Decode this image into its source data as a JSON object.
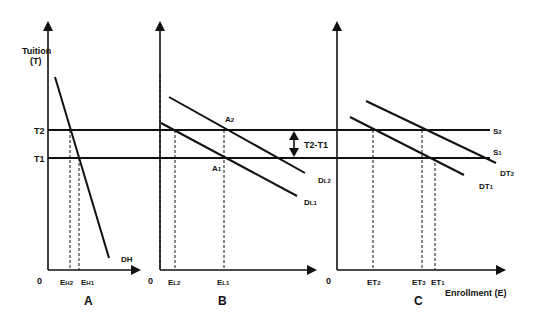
{
  "diagram": {
    "y_axis_label_line1": "Tuition",
    "y_axis_label_line2": "(T)",
    "x_axis_label": "Enrollment (E)",
    "tuition_levels": {
      "high": "T2",
      "low": "T1"
    },
    "difference_label": "T2-T1",
    "panels": [
      {
        "id": "A",
        "title": "A",
        "origin": "0",
        "curves": [
          {
            "label": "DH"
          }
        ],
        "x_ticks": [
          {
            "sub_main": "E",
            "sub": "H2"
          },
          {
            "sub_main": "E",
            "sub": "H1"
          }
        ]
      },
      {
        "id": "B",
        "title": "B",
        "origin": "0",
        "curves": [
          {
            "label_main": "D",
            "label_sub": "L2"
          },
          {
            "label_main": "D",
            "label_sub": "L1"
          }
        ],
        "points": [
          {
            "main": "A",
            "sub": "2"
          },
          {
            "main": "A",
            "sub": "1"
          }
        ],
        "x_ticks": [
          {
            "sub_main": "E",
            "sub": "L2"
          },
          {
            "sub_main": "E",
            "sub": "L1"
          }
        ]
      },
      {
        "id": "C",
        "title": "C",
        "origin": "0",
        "curves": [
          {
            "label_main": "DT",
            "label_sub": "2"
          },
          {
            "label_main": "DT",
            "label_sub": "1"
          }
        ],
        "supply": [
          {
            "main": "S",
            "sub": "2"
          },
          {
            "main": "S",
            "sub": "1"
          }
        ],
        "x_ticks": [
          {
            "sub_main": "ET",
            "sub": "2"
          },
          {
            "sub_main": "ET",
            "sub": "3"
          },
          {
            "sub_main": "ET",
            "sub": "1"
          }
        ]
      }
    ]
  }
}
